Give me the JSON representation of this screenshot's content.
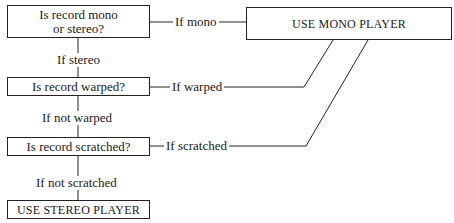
{
  "diagram": {
    "type": "decision-flowchart",
    "nodes": [
      {
        "id": "q_mono_stereo",
        "kind": "question",
        "text_line1": "Is record mono",
        "text_line2": "or stereo?"
      },
      {
        "id": "q_warped",
        "kind": "question",
        "text": "Is record warped?"
      },
      {
        "id": "q_scratched",
        "kind": "question",
        "text": "Is record scratched?"
      },
      {
        "id": "use_mono",
        "kind": "outcome",
        "text": "USE MONO PLAYER"
      },
      {
        "id": "use_stereo",
        "kind": "outcome",
        "text": "USE STEREO PLAYER"
      }
    ],
    "edges": [
      {
        "from": "q_mono_stereo",
        "to": "use_mono",
        "label": "If mono"
      },
      {
        "from": "q_mono_stereo",
        "to": "q_warped",
        "label": "If stereo"
      },
      {
        "from": "q_warped",
        "to": "use_mono",
        "label": "If warped"
      },
      {
        "from": "q_warped",
        "to": "q_scratched",
        "label": "If not warped"
      },
      {
        "from": "q_scratched",
        "to": "use_mono",
        "label": "If scratched"
      },
      {
        "from": "q_scratched",
        "to": "use_stereo",
        "label": "If not scratched"
      }
    ]
  }
}
